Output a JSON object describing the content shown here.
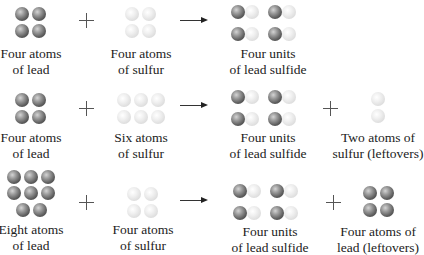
{
  "colors": {
    "lead": "#5d5d5d",
    "sulfur": "#e2e2e2"
  },
  "rows": [
    {
      "reactant1": {
        "label_line1": "Four atoms",
        "label_line2": "of lead",
        "atom": "lead",
        "count": 4
      },
      "plus1": "+",
      "reactant2": {
        "label_line1": "Four atoms",
        "label_line2": "of sulfur",
        "atom": "sulfur",
        "count": 4
      },
      "arrow": "→",
      "product": {
        "label_line1": "Four units",
        "label_line2": "of lead sulfide",
        "unit": "PbS",
        "count": 4
      }
    },
    {
      "reactant1": {
        "label_line1": "Four atoms",
        "label_line2": "of lead",
        "atom": "lead",
        "count": 4
      },
      "plus1": "+",
      "reactant2": {
        "label_line1": "Six atoms",
        "label_line2": "of sulfur",
        "atom": "sulfur",
        "count": 6
      },
      "arrow": "→",
      "product": {
        "label_line1": "Four units",
        "label_line2": "of lead sulfide",
        "unit": "PbS",
        "count": 4
      },
      "plus2": "+",
      "leftover": {
        "label_line1": "Two atoms of",
        "label_line2": "sulfur (leftovers)",
        "atom": "sulfur",
        "count": 2
      }
    },
    {
      "reactant1": {
        "label_line1": "Eight atoms",
        "label_line2": "of lead",
        "atom": "lead",
        "count": 8
      },
      "plus1": "+",
      "reactant2": {
        "label_line1": "Four atoms",
        "label_line2": "of sulfur",
        "atom": "sulfur",
        "count": 4
      },
      "arrow": "→",
      "product": {
        "label_line1": "Four units",
        "label_line2": "of lead sulfide",
        "unit": "PbS",
        "count": 4
      },
      "plus2": "+",
      "leftover": {
        "label_line1": "Four atoms of",
        "label_line2": "lead (leftovers)",
        "atom": "lead",
        "count": 4
      }
    }
  ]
}
